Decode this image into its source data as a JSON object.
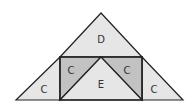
{
  "diagram": {
    "colors": {
      "light_fill": "#e6e6e6",
      "dark_fill": "#c2c2c2",
      "stroke": "#222222",
      "label": "#333333"
    },
    "regions": [
      {
        "id": "top",
        "label": "D"
      },
      {
        "id": "left-outer",
        "label": "C"
      },
      {
        "id": "left-inner",
        "label": "C"
      },
      {
        "id": "center",
        "label": "E"
      },
      {
        "id": "right-inner",
        "label": "C"
      },
      {
        "id": "right-outer",
        "label": "C"
      }
    ]
  }
}
